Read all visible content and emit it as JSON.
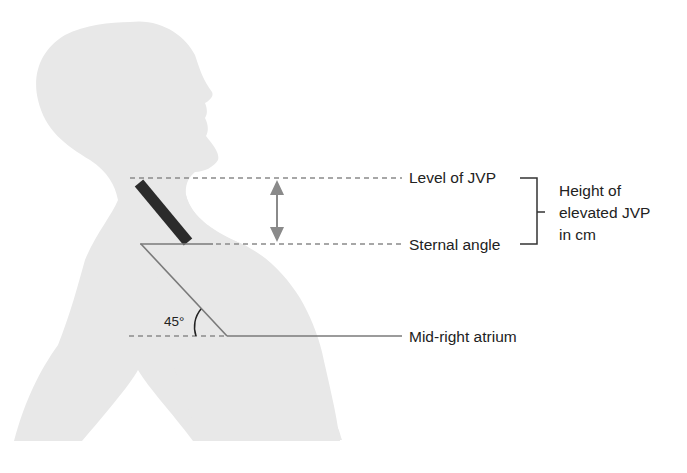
{
  "diagram": {
    "type": "anatomical-schematic",
    "labels": {
      "level_of_jvp": "Level of JVP",
      "sternal_angle": "Sternal angle",
      "mid_right_atrium": "Mid-right atrium",
      "height_line1": "Height of",
      "height_line2": "elevated JVP",
      "height_line3": "in cm",
      "angle": "45°"
    },
    "colors": {
      "silhouette": "#e8e8e8",
      "jugular_vein": "#2b2b2b",
      "dashed_line": "#8a8a8a",
      "solid_line": "#7a7a7a",
      "arrow": "#8a8a8a",
      "text": "#222222",
      "bracket": "#333333"
    }
  }
}
